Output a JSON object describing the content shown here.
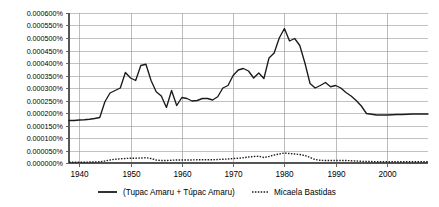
{
  "chart_data": {
    "type": "line",
    "title": "",
    "subtitle": "",
    "xlabel": "",
    "ylabel": "",
    "xlim": [
      1938,
      2008
    ],
    "ylim": [
      0.0,
      0.0006
    ],
    "grid": true,
    "legend_position": "bottom",
    "y_tick_labels": [
      "0.000600%",
      "0.000550%",
      "0.000500%",
      "0.000450%",
      "0.000400%",
      "0.000350%",
      "0.000300%",
      "0.000250%",
      "0.000200%",
      "0.000150%",
      "0.000100%",
      "0.000050%",
      "0.000000%"
    ],
    "y_tick_values": [
      0.0006,
      0.00055,
      0.0005,
      0.00045,
      0.0004,
      0.00035,
      0.0003,
      0.00025,
      0.0002,
      0.00015,
      0.0001,
      5e-05,
      0.0
    ],
    "x_tick_labels": [
      "1940",
      "1950",
      "1960",
      "1970",
      "1980",
      "1990",
      "2000"
    ],
    "x_tick_values": [
      1940,
      1950,
      1960,
      1970,
      1980,
      1990,
      2000
    ],
    "x": [
      1938,
      1939,
      1940,
      1941,
      1942,
      1943,
      1944,
      1945,
      1946,
      1947,
      1948,
      1949,
      1950,
      1951,
      1952,
      1953,
      1954,
      1955,
      1956,
      1957,
      1958,
      1959,
      1960,
      1961,
      1962,
      1963,
      1964,
      1965,
      1966,
      1967,
      1968,
      1969,
      1970,
      1971,
      1972,
      1973,
      1974,
      1975,
      1976,
      1977,
      1978,
      1979,
      1980,
      1981,
      1982,
      1983,
      1984,
      1985,
      1986,
      1987,
      1988,
      1989,
      1990,
      1991,
      1992,
      1993,
      1994,
      1995,
      1996,
      1997,
      1998,
      1999,
      2000,
      2001,
      2002,
      2003,
      2004,
      2005,
      2006,
      2007,
      2008
    ],
    "series": [
      {
        "name": "(Tupac Amaru + Túpac Amaru)",
        "style": "solid",
        "color": "#1b1b1b",
        "values": [
          0.00017,
          0.00017,
          0.000172,
          0.000173,
          0.000175,
          0.000178,
          0.000182,
          0.000245,
          0.00028,
          0.00029,
          0.0003,
          0.000362,
          0.00034,
          0.00033,
          0.00039,
          0.000395,
          0.00033,
          0.000285,
          0.000268,
          0.000222,
          0.00029,
          0.00023,
          0.000262,
          0.000258,
          0.000248,
          0.00025,
          0.000258,
          0.000258,
          0.000252,
          0.000265,
          0.0003,
          0.00031,
          0.00035,
          0.000372,
          0.000378,
          0.000368,
          0.00034,
          0.00036,
          0.000338,
          0.00042,
          0.00044,
          0.0005,
          0.000538,
          0.000488,
          0.000498,
          0.00047,
          0.0004,
          0.000318,
          0.0003,
          0.00031,
          0.000322,
          0.000305,
          0.00031,
          0.0003,
          0.000282,
          0.000268,
          0.00025,
          0.000228,
          0.000198,
          0.000195,
          0.000192,
          0.000192,
          0.000192,
          0.000193,
          0.000194,
          0.000194,
          0.000195,
          0.000196,
          0.000196,
          0.000196,
          0.000196
        ]
      },
      {
        "name": "Micaela Bastidas",
        "style": "dotted",
        "color": "#1b1b1b",
        "values": [
          3e-06,
          3e-06,
          3e-06,
          3e-06,
          4e-06,
          4e-06,
          5e-06,
          8e-06,
          1.2e-05,
          1.5e-05,
          1.7e-05,
          1.8e-05,
          1.9e-05,
          1.9e-05,
          2e-05,
          2.1e-05,
          1.8e-05,
          1.2e-05,
          1e-05,
          1e-05,
          1.1e-05,
          1.2e-05,
          1.2e-05,
          1.2e-05,
          1.2e-05,
          1.3e-05,
          1.3e-05,
          1.3e-05,
          1.3e-05,
          1.4e-05,
          1.5e-05,
          1.6e-05,
          1.8e-05,
          1.9e-05,
          2.1e-05,
          2.4e-05,
          2.6e-05,
          2.7e-05,
          2.2e-05,
          2.6e-05,
          3.2e-05,
          3.6e-05,
          4e-05,
          3.8e-05,
          3.6e-05,
          3.4e-05,
          3e-05,
          2.2e-05,
          1.4e-05,
          1.1e-05,
          1e-05,
          1e-05,
          1e-05,
          1e-05,
          1e-05,
          9e-06,
          8e-06,
          7e-06,
          6e-06,
          6e-06,
          5e-06,
          5e-06,
          5e-06,
          5e-06,
          5e-06,
          5e-06,
          5e-06,
          5e-06,
          5e-06,
          5e-06,
          5e-06
        ]
      }
    ],
    "legend": [
      {
        "label": "(Tupac Amaru + Túpac Amaru)",
        "style": "solid"
      },
      {
        "label": "Micaela Bastidas",
        "style": "dotted"
      }
    ]
  }
}
